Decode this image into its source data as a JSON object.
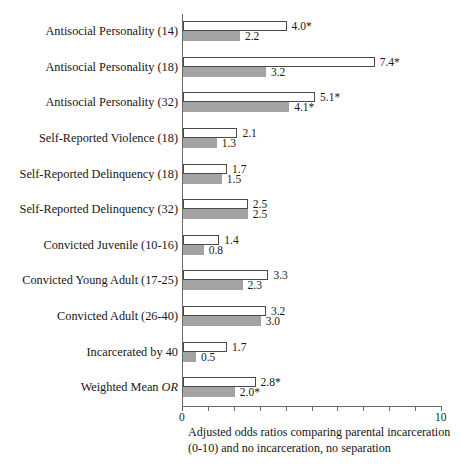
{
  "chart_data": {
    "type": "bar",
    "orientation": "horizontal",
    "title": "",
    "subtitle": "",
    "xlabel": "Adjusted odds ratios comparing parental incarceration (0-10) and no incarceration, no separation",
    "ylabel": "",
    "xlim": [
      0,
      10
    ],
    "xticks": [
      0,
      1,
      2,
      3,
      4,
      5,
      6,
      7,
      8,
      9,
      10
    ],
    "xtick_labels_shown": [
      "0",
      "10"
    ],
    "grid": false,
    "legend_position": "none",
    "categories": [
      "Antisocial Personality (14)",
      "Antisocial Personality (18)",
      "Antisocial Personality (32)",
      "Self-Reported Violence (18)",
      "Self-Reported Delinquency (18)",
      "Self-Reported Delinquency (32)",
      "Convicted Juvenile (10-16)",
      "Convicted Young Adult (17-25)",
      "Convicted Adult (26-40)",
      "Incarcerated by 40",
      "Weighted Mean OR"
    ],
    "series": [
      {
        "name": "unadjusted",
        "style": "open",
        "values": [
          4.0,
          7.4,
          5.1,
          2.1,
          1.7,
          2.5,
          1.4,
          3.3,
          3.2,
          1.7,
          2.8
        ],
        "labels": [
          "4.0*",
          "7.4*",
          "5.1*",
          "2.1",
          "1.7",
          "2.5",
          "1.4",
          "3.3",
          "3.2",
          "1.7",
          "2.8*"
        ]
      },
      {
        "name": "adjusted",
        "style": "filled",
        "values": [
          2.2,
          3.2,
          4.1,
          1.3,
          1.5,
          2.5,
          0.8,
          2.3,
          3.0,
          0.5,
          2.0
        ],
        "labels": [
          "2.2",
          "3.2",
          "4.1*",
          "1.3",
          "1.5",
          "2.5",
          "0.8",
          "2.3",
          "3.0",
          "0.5",
          "2.0*"
        ]
      }
    ],
    "significance_note": "* denotes statistical significance",
    "colors": {
      "open_bar_fill": "#ffffff",
      "open_bar_stroke": "#4a4a4a",
      "filled_bar": "#a3a3a3",
      "axis": "#6a6a6a",
      "text": "#1a1a1a"
    }
  },
  "axis": {
    "tick_label_min": "0",
    "tick_label_max": "10"
  },
  "caption": {
    "line1": "Adjusted odds ratios comparing parental incarceration",
    "line2": "(0-10) and no incarceration, no separation"
  },
  "categories_labels": {
    "weighted_mean_prefix": "Weighted Mean ",
    "weighted_mean_italic": "OR"
  }
}
